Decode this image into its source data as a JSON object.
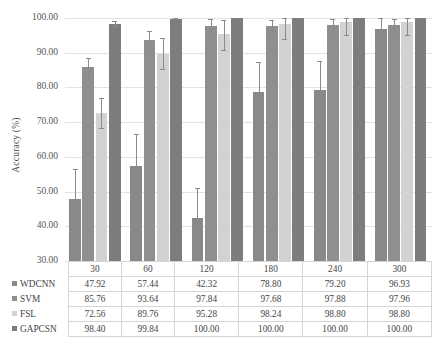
{
  "chart_data": {
    "type": "bar",
    "title": "",
    "xlabel": "",
    "ylabel": "Accuracy (%)",
    "ylim": [
      30,
      100
    ],
    "yticks": [
      "30.00",
      "40.00",
      "50.00",
      "60.00",
      "70.00",
      "80.00",
      "90.00",
      "100.00"
    ],
    "grid": true,
    "legend_position": "table-row-headers",
    "categories": [
      "30",
      "60",
      "120",
      "180",
      "240",
      "300"
    ],
    "series": [
      {
        "name": "WDCNN",
        "color": "#898989",
        "values": [
          47.92,
          57.44,
          42.32,
          78.8,
          79.2,
          96.93
        ],
        "labels": [
          "47.92",
          "57.44",
          "42.32",
          "78.80",
          "79.20",
          "96.93"
        ],
        "err_low": [
          39.3,
          48.9,
          34.2,
          70.4,
          71.0,
          88.6
        ],
        "err_high": [
          56.5,
          66.6,
          51.0,
          87.3,
          87.6,
          100.0
        ]
      },
      {
        "name": "SVM",
        "color": "#8f8f8f",
        "values": [
          85.76,
          93.64,
          97.84,
          97.68,
          97.88,
          97.96
        ],
        "labels": [
          "85.76",
          "93.64",
          "97.84",
          "97.68",
          "97.88",
          "97.96"
        ],
        "err_low": [
          83.1,
          91.0,
          96.1,
          95.9,
          96.0,
          96.1
        ],
        "err_high": [
          88.4,
          96.3,
          99.6,
          99.5,
          99.6,
          99.7
        ]
      },
      {
        "name": "FSL",
        "color": "#d2d2d2",
        "values": [
          72.56,
          89.76,
          95.28,
          98.24,
          98.8,
          98.8
        ],
        "labels": [
          "72.56",
          "89.76",
          "95.28",
          "98.24",
          "98.80",
          "98.80"
        ],
        "err_low": [
          68.2,
          85.3,
          90.8,
          94.0,
          95.0,
          95.1
        ],
        "err_high": [
          76.9,
          94.2,
          99.3,
          100.0,
          100.0,
          100.0
        ]
      },
      {
        "name": "GAPCSN",
        "color": "#7d7d7d",
        "values": [
          98.4,
          99.84,
          100.0,
          100.0,
          100.0,
          100.0
        ],
        "labels": [
          "98.40",
          "99.84",
          "100.00",
          "100.00",
          "100.00",
          "100.00"
        ],
        "err_low": [
          97.7,
          99.6,
          100.0,
          100.0,
          100.0,
          100.0
        ],
        "err_high": [
          99.1,
          100.0,
          100.0,
          100.0,
          100.0,
          100.0
        ]
      }
    ]
  },
  "table": {
    "corner_label": "",
    "column_headers": [
      "30",
      "60",
      "120",
      "180",
      "240",
      "300"
    ],
    "rows": [
      {
        "label": "WDCNN",
        "color": "#898989",
        "cells": [
          "47.92",
          "57.44",
          "42.32",
          "78.80",
          "79.20",
          "96.93"
        ]
      },
      {
        "label": "SVM",
        "color": "#8f8f8f",
        "cells": [
          "85.76",
          "93.64",
          "97.84",
          "97.68",
          "97.88",
          "97.96"
        ]
      },
      {
        "label": "FSL",
        "color": "#d2d2d2",
        "cells": [
          "72.56",
          "89.76",
          "95.28",
          "98.24",
          "98.80",
          "98.80"
        ]
      },
      {
        "label": "GAPCSN",
        "color": "#7d7d7d",
        "cells": [
          "98.40",
          "99.84",
          "100.00",
          "100.00",
          "100.00",
          "100.00"
        ]
      }
    ]
  }
}
